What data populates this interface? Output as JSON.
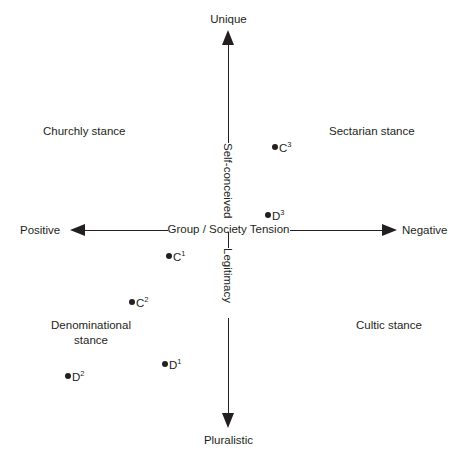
{
  "diagram": {
    "poles": {
      "top": "Unique",
      "bottom": "Pluralistic",
      "left": "Positive",
      "right": "Negative"
    },
    "axes": {
      "horizontal_label": "Group / Society Tension",
      "vertical_upper_label": "Self-conceived",
      "vertical_lower_label": "Legitimacy"
    },
    "quadrants": {
      "top_left": "Churchly stance",
      "top_right": "Sectarian stance",
      "bottom_left_line1": "Denominational",
      "bottom_left_line2": "stance",
      "bottom_right": "Cultic stance"
    },
    "points": [
      {
        "id": "c3",
        "base": "C",
        "sup": "3",
        "x": 272,
        "y": 141
      },
      {
        "id": "d3",
        "base": "D",
        "sup": "3",
        "x": 265,
        "y": 209
      },
      {
        "id": "c1",
        "base": "C",
        "sup": "1",
        "x": 166,
        "y": 250
      },
      {
        "id": "c2",
        "base": "C",
        "sup": "2",
        "x": 129,
        "y": 296
      },
      {
        "id": "d1",
        "base": "D",
        "sup": "1",
        "x": 162,
        "y": 358
      },
      {
        "id": "d2",
        "base": "D",
        "sup": "2",
        "x": 65,
        "y": 370
      }
    ],
    "colors": {
      "ink": "#231f20",
      "background": "#ffffff"
    }
  }
}
